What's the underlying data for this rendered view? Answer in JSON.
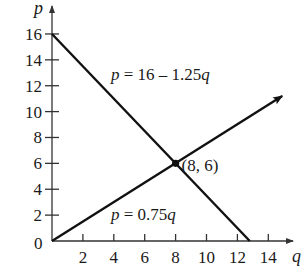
{
  "chart_data": {
    "type": "line",
    "title": "",
    "xlabel": "q",
    "ylabel": "p",
    "xlim": [
      0,
      15
    ],
    "ylim": [
      0,
      17
    ],
    "grid": false,
    "x_ticks": [
      2,
      4,
      6,
      8,
      10,
      12,
      14
    ],
    "y_ticks": [
      2,
      4,
      6,
      8,
      10,
      12,
      14,
      16
    ],
    "origin_label": "0",
    "series": [
      {
        "name": "demand",
        "equation": "p = 16 – 1.25q",
        "label_parts": [
          "p",
          " = 16 – 1.25",
          "q"
        ],
        "x": [
          0,
          12.8
        ],
        "y": [
          16,
          0
        ],
        "arrow": false
      },
      {
        "name": "supply",
        "equation": "p = 0.75q",
        "label_parts": [
          "p",
          " = 0.75",
          "q"
        ],
        "x": [
          0,
          14.9
        ],
        "y": [
          0,
          11.2
        ],
        "arrow": true
      }
    ],
    "annotations": [
      {
        "text": "(8, 6)",
        "x": 8,
        "y": 6,
        "marker": "point"
      }
    ]
  },
  "colors": {
    "line": "#111111",
    "axis": "#333333",
    "text": "#1a1a1a"
  }
}
